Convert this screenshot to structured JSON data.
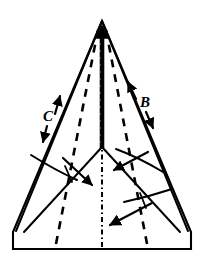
{
  "figure": {
    "type": "line-art-diagram",
    "background_color": "#ffffff",
    "ink_color": "#000000",
    "labels": [
      {
        "id": "B",
        "text": "B",
        "x": 143,
        "y": 102,
        "meaning": "fold-direction-label-right"
      },
      {
        "id": "C",
        "text": "C",
        "x": 48,
        "y": 118,
        "meaning": "fold-direction-label-left"
      }
    ],
    "line_styles": {
      "outline": "solid",
      "fold_lines": "dashed",
      "center_line": "dash-dot",
      "center_slit": "solid-thick"
    },
    "geometry": {
      "apex": [
        102,
        21
      ],
      "left_shoulder": [
        13,
        232
      ],
      "right_shoulder": [
        191,
        232
      ],
      "bottom_left": [
        13,
        249
      ],
      "bottom_right": [
        191,
        249
      ],
      "center_junction": [
        102,
        147
      ],
      "dashed_bottom_left_x": 55,
      "dashed_bottom_right_x": 148,
      "center_line_x": 102
    },
    "arrows": [
      {
        "name": "apex-up-arrow",
        "direction": "up"
      },
      {
        "name": "edge-arrow-right-up",
        "direction": "up-right"
      },
      {
        "name": "edge-arrow-right-down",
        "direction": "down-right"
      },
      {
        "name": "edge-arrow-left-up",
        "direction": "up-left"
      },
      {
        "name": "edge-arrow-left-down",
        "direction": "down-left"
      },
      {
        "name": "fold-arrow-center-down-right",
        "direction": "down-right"
      },
      {
        "name": "fold-arrow-center-down-left",
        "direction": "down-left"
      },
      {
        "name": "fold-arrow-lower-down-left",
        "direction": "down-left"
      }
    ]
  }
}
